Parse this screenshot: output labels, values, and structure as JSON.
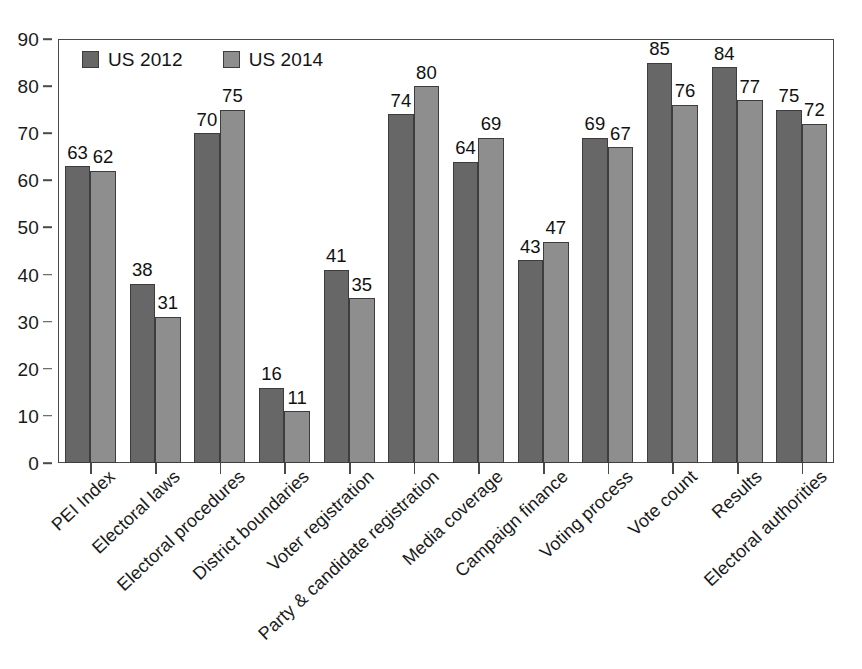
{
  "chart_data": {
    "type": "bar",
    "title": "",
    "subtitle": "",
    "xlabel": "",
    "ylabel": "",
    "ylim": [
      0,
      90
    ],
    "yticks": [
      0,
      10,
      20,
      30,
      40,
      50,
      60,
      70,
      80,
      90
    ],
    "grid": false,
    "legend_position": "top-left",
    "orientation": "vertical",
    "categories": [
      "PEI Index",
      "Electoral laws",
      "Electoral procedures",
      "District boundaries",
      "Voter registration",
      "Party & candidate registration",
      "Media coverage",
      "Campaign finance",
      "Voting process",
      "Vote count",
      "Results",
      "Electoral authorities"
    ],
    "series": [
      {
        "name": "US 2012",
        "color": "#676767",
        "values": [
          63,
          38,
          70,
          16,
          41,
          74,
          64,
          43,
          69,
          85,
          84,
          75
        ]
      },
      {
        "name": "US 2014",
        "color": "#8e8e8e",
        "values": [
          62,
          31,
          75,
          11,
          35,
          80,
          69,
          47,
          67,
          76,
          77,
          72
        ]
      }
    ]
  },
  "axis": {
    "y_tick_labels": [
      "0",
      "10",
      "20",
      "30",
      "40",
      "50",
      "60",
      "70",
      "80",
      "90"
    ]
  },
  "legend": {
    "items": [
      {
        "label": "US 2012"
      },
      {
        "label": "US 2014"
      }
    ]
  },
  "style": {
    "series_0_color": "#676767",
    "series_1_color": "#8e8e8e",
    "frame_color": "#4a4a4a",
    "background": "#ffffff",
    "text_color": "#1a1a1a"
  }
}
